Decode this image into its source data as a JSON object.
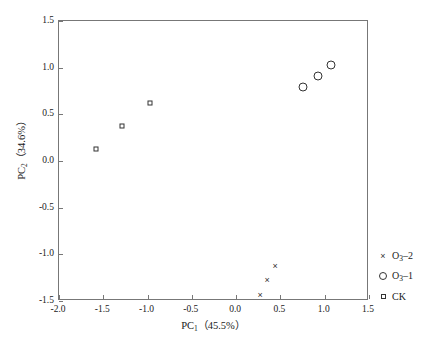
{
  "chart_data": {
    "type": "scatter",
    "title": "",
    "xlabel": "PC1 (45.5%)",
    "ylabel": "PC2 (34.6%)",
    "xlabel_parts": {
      "prefix": "PC",
      "sub": "1",
      "suffix": "（45.5%）"
    },
    "ylabel_parts": {
      "prefix": "PC",
      "sub": "2",
      "suffix": "（34.6%）"
    },
    "xlim": [
      -2.0,
      1.5
    ],
    "ylim": [
      -1.5,
      1.5
    ],
    "xticks": [
      -2.0,
      -1.5,
      -1.0,
      -0.5,
      0.0,
      0.5,
      1.0,
      1.5
    ],
    "yticks": [
      -1.5,
      -1.0,
      -0.5,
      0.0,
      0.5,
      1.0,
      1.5
    ],
    "xticklabels": [
      "-2.0",
      "-1.5",
      "-1.0",
      "-0.5",
      "0.0",
      "0.5",
      "1.0",
      "1.5"
    ],
    "yticklabels": [
      "-1.5",
      "-1.0",
      "-0.5",
      "0.0",
      "0.5",
      "1.0",
      "1.5"
    ],
    "grid": false,
    "legend_position": "right-outside",
    "series": [
      {
        "name": "O3-2",
        "marker": "cross",
        "points": [
          {
            "x": 0.27,
            "y": -1.44
          },
          {
            "x": 0.35,
            "y": -1.28
          },
          {
            "x": 0.44,
            "y": -1.12
          }
        ]
      },
      {
        "name": "O3-1",
        "marker": "circle",
        "points": [
          {
            "x": 0.76,
            "y": 0.79
          },
          {
            "x": 0.92,
            "y": 0.91
          },
          {
            "x": 1.07,
            "y": 1.03
          }
        ]
      },
      {
        "name": "CK",
        "marker": "square",
        "points": [
          {
            "x": -1.58,
            "y": 0.13
          },
          {
            "x": -1.29,
            "y": 0.37
          },
          {
            "x": -0.97,
            "y": 0.62
          }
        ]
      }
    ]
  },
  "legend": {
    "items": [
      {
        "symbol": "cross",
        "prefix": "O",
        "sub": "3",
        "suffix": "–2",
        "label": "O3–2"
      },
      {
        "symbol": "circle",
        "prefix": "O",
        "sub": "3",
        "suffix": "–1",
        "label": "O3–1"
      },
      {
        "symbol": "square",
        "prefix": "CK",
        "sub": "",
        "suffix": "",
        "label": "CK"
      }
    ]
  },
  "caption": {
    "text": ""
  },
  "colors": {
    "marker": "#333333",
    "frame": "#777777",
    "text": "#1a1a1a",
    "background": "#ffffff"
  }
}
